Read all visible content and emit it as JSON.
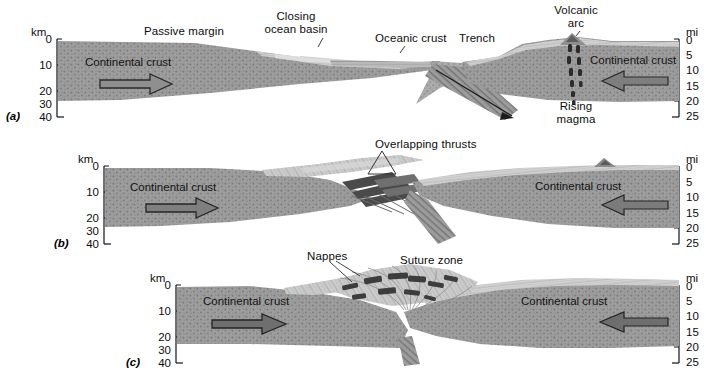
{
  "figure": {
    "type": "geologic-cross-section-series",
    "panels": [
      {
        "id": "a",
        "label": "(a)",
        "left_axis": {
          "unit": "km",
          "ticks": [
            "0",
            "10",
            "20",
            "30",
            "40"
          ]
        },
        "right_axis": {
          "unit": "mi",
          "ticks": [
            "0",
            "5",
            "10",
            "15",
            "20",
            "25"
          ]
        },
        "annotations": [
          {
            "name": "passive-margin",
            "text": "Passive margin"
          },
          {
            "name": "closing-ocean-basin",
            "text": "Closing\nocean basin"
          },
          {
            "name": "oceanic-crust",
            "text": "Oceanic crust"
          },
          {
            "name": "trench",
            "text": "Trench"
          },
          {
            "name": "volcanic-arc",
            "text": "Volcanic\narc"
          },
          {
            "name": "rising-magma",
            "text": "Rising\nmagma"
          },
          {
            "name": "continental-crust-left",
            "text": "Continental crust"
          },
          {
            "name": "continental-crust-right",
            "text": "Continental crust"
          }
        ]
      },
      {
        "id": "b",
        "label": "(b)",
        "left_axis": {
          "unit": "km",
          "ticks": [
            "0",
            "10",
            "20",
            "30",
            "40"
          ]
        },
        "right_axis": {
          "unit": "mi",
          "ticks": [
            "0",
            "5",
            "10",
            "15",
            "20",
            "25"
          ]
        },
        "annotations": [
          {
            "name": "overlapping-thrusts",
            "text": "Overlapping thrusts"
          },
          {
            "name": "continental-crust-left",
            "text": "Continental crust"
          },
          {
            "name": "continental-crust-right",
            "text": "Continental crust"
          }
        ]
      },
      {
        "id": "c",
        "label": "(c)",
        "left_axis": {
          "unit": "km",
          "ticks": [
            "0",
            "10",
            "20",
            "30",
            "40"
          ]
        },
        "right_axis": {
          "unit": "mi",
          "ticks": [
            "0",
            "5",
            "10",
            "15",
            "20",
            "25"
          ]
        },
        "annotations": [
          {
            "name": "nappes",
            "text": "Nappes"
          },
          {
            "name": "suture-zone",
            "text": "Suture zone"
          },
          {
            "name": "continental-crust-left",
            "text": "Continental crust"
          },
          {
            "name": "continental-crust-right",
            "text": "Continental crust"
          }
        ]
      }
    ],
    "colors": {
      "continental_crust": "#9a9a9a",
      "mantle_background": "#ffffff",
      "sediment_light": "#cfcfcf",
      "subducting_slab": "#6b6b6b",
      "magma_dark": "#2f2f2f",
      "text": "#0d0d0d"
    }
  }
}
